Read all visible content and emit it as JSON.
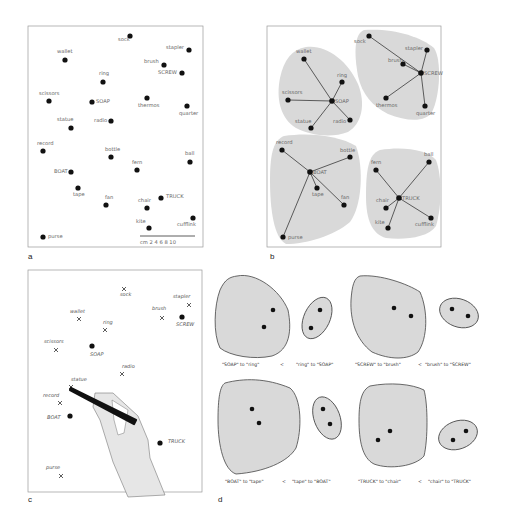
{
  "panels": {
    "a": {
      "letter": "a",
      "items": [
        {
          "label": "sock",
          "x": 130,
          "y": 36,
          "lx": -12,
          "ly": 5
        },
        {
          "label": "stapler",
          "x": 189,
          "y": 50,
          "lx": -23,
          "ly": -1
        },
        {
          "label": "wallet",
          "x": 65,
          "y": 60,
          "lx": -8,
          "ly": -7
        },
        {
          "label": "brush",
          "x": 164,
          "y": 65,
          "lx": -20,
          "ly": -2
        },
        {
          "label": "SCREW",
          "x": 182,
          "y": 73,
          "lx": -24,
          "ly": 1
        },
        {
          "label": "ring",
          "x": 103,
          "y": 82,
          "lx": -4,
          "ly": -7
        },
        {
          "label": "scissors",
          "x": 49,
          "y": 101,
          "lx": -10,
          "ly": -6
        },
        {
          "label": "SOAP",
          "x": 92,
          "y": 102,
          "lx": 4,
          "ly": 1
        },
        {
          "label": "thermos",
          "x": 147,
          "y": 98,
          "lx": -9,
          "ly": 9
        },
        {
          "label": "quarter",
          "x": 187,
          "y": 106,
          "lx": -8,
          "ly": 9
        },
        {
          "label": "radio",
          "x": 111,
          "y": 121,
          "lx": -17,
          "ly": 1
        },
        {
          "label": "statue",
          "x": 71,
          "y": 128,
          "lx": -14,
          "ly": -7
        },
        {
          "label": "record",
          "x": 43,
          "y": 151,
          "lx": -6,
          "ly": -6
        },
        {
          "label": "bottle",
          "x": 111,
          "y": 157,
          "lx": -6,
          "ly": -6
        },
        {
          "label": "ball",
          "x": 190,
          "y": 162,
          "lx": -5,
          "ly": -7
        },
        {
          "label": "fern",
          "x": 137,
          "y": 170,
          "lx": -5,
          "ly": -6
        },
        {
          "label": "BOAT",
          "x": 71,
          "y": 172,
          "lx": -17,
          "ly": 1
        },
        {
          "label": "tape",
          "x": 78,
          "y": 188,
          "lx": -5,
          "ly": 8
        },
        {
          "label": "TRUCK",
          "x": 161,
          "y": 198,
          "lx": 5,
          "ly": 0
        },
        {
          "label": "fan",
          "x": 106,
          "y": 205,
          "lx": -1,
          "ly": -6
        },
        {
          "label": "chair",
          "x": 147,
          "y": 208,
          "lx": -9,
          "ly": -6
        },
        {
          "label": "cufflink",
          "x": 193,
          "y": 218,
          "lx": -16,
          "ly": 8
        },
        {
          "label": "kite",
          "x": 149,
          "y": 228,
          "lx": -13,
          "ly": -5
        },
        {
          "label": "purse",
          "x": 43,
          "y": 237,
          "lx": 5,
          "ly": 1
        }
      ],
      "scale": {
        "unit": "cm",
        "ticks": [
          "2",
          "4",
          "6",
          "8",
          "10"
        ]
      }
    },
    "b": {
      "letter": "b",
      "clusters": [
        {
          "hub": "SOAP",
          "hx": 332,
          "hy": 101,
          "members": [
            {
              "label": "wallet",
              "x": 304,
              "y": 59,
              "lx": -8,
              "ly": -6
            },
            {
              "label": "ring",
              "x": 342,
              "y": 82,
              "lx": -5,
              "ly": -5
            },
            {
              "label": "scissors",
              "x": 288,
              "y": 100,
              "lx": -6,
              "ly": -6
            },
            {
              "label": "statue",
              "x": 311,
              "y": 128,
              "lx": -16,
              "ly": -5
            },
            {
              "label": "radio",
              "x": 350,
              "y": 120,
              "lx": -17,
              "ly": 3
            }
          ]
        },
        {
          "hub": "SCREW",
          "hx": 421,
          "hy": 73,
          "members": [
            {
              "label": "sock",
              "x": 369,
              "y": 36,
              "lx": -15,
              "ly": 7
            },
            {
              "label": "stapler",
              "x": 427,
              "y": 50,
              "lx": -22,
              "ly": 0
            },
            {
              "label": "brush",
              "x": 403,
              "y": 64,
              "lx": -15,
              "ly": -2
            },
            {
              "label": "thermos",
              "x": 386,
              "y": 98,
              "lx": -10,
              "ly": 9
            },
            {
              "label": "quarter",
              "x": 425,
              "y": 106,
              "lx": -9,
              "ly": 9
            }
          ]
        },
        {
          "hub": "BOAT",
          "hx": 310,
          "hy": 172,
          "members": [
            {
              "label": "record",
              "x": 282,
              "y": 150,
              "lx": -6,
              "ly": -6
            },
            {
              "label": "bottle",
              "x": 350,
              "y": 157,
              "lx": -10,
              "ly": -5
            },
            {
              "label": "tape",
              "x": 317,
              "y": 188,
              "lx": -5,
              "ly": 8
            },
            {
              "label": "fan",
              "x": 344,
              "y": 205,
              "lx": -3,
              "ly": -6
            },
            {
              "label": "purse",
              "x": 283,
              "y": 237,
              "lx": 5,
              "ly": 2
            }
          ]
        },
        {
          "hub": "TRUCK",
          "hx": 399,
          "hy": 198,
          "members": [
            {
              "label": "fern",
              "x": 376,
              "y": 170,
              "lx": -5,
              "ly": -6
            },
            {
              "label": "ball",
              "x": 429,
              "y": 162,
              "lx": -5,
              "ly": -6
            },
            {
              "label": "chair",
              "x": 386,
              "y": 208,
              "lx": -10,
              "ly": -6
            },
            {
              "label": "kite",
              "x": 388,
              "y": 228,
              "lx": -13,
              "ly": -4
            },
            {
              "label": "cufflink",
              "x": 431,
              "y": 218,
              "lx": -16,
              "ly": 8
            }
          ]
        }
      ],
      "hub_labels": {
        "SOAP": "SOAP",
        "SCREW": "SCREW",
        "BOAT": "BOAT",
        "TRUCK": "TRUCK"
      }
    },
    "c": {
      "letter": "c",
      "crosses": [
        {
          "label": "sock",
          "x": 124,
          "y": 289,
          "lx": -4,
          "ly": 7
        },
        {
          "label": "stapler",
          "x": 189,
          "y": 305,
          "lx": -16,
          "ly": -7
        },
        {
          "label": "wallet",
          "x": 79,
          "y": 319,
          "lx": -9,
          "ly": -6
        },
        {
          "label": "brush",
          "x": 162,
          "y": 318,
          "lx": -10,
          "ly": -8
        },
        {
          "label": "ring",
          "x": 105,
          "y": 330,
          "lx": -2,
          "ly": -6
        },
        {
          "label": "scissors",
          "x": 56,
          "y": 350,
          "lx": -12,
          "ly": -7
        },
        {
          "label": "radio",
          "x": 122,
          "y": 374,
          "lx": 0,
          "ly": -6
        },
        {
          "label": "statue",
          "x": 71,
          "y": 387,
          "lx": 0,
          "ly": -6
        },
        {
          "label": "record",
          "x": 60,
          "y": 403,
          "lx": -17,
          "ly": -6
        },
        {
          "label": "purse",
          "x": 61,
          "y": 476,
          "lx": -15,
          "ly": -7
        }
      ],
      "dots": [
        {
          "label": "SCREW",
          "x": 182,
          "y": 317,
          "lx": -6,
          "ly": 9
        },
        {
          "label": "SOAP",
          "x": 92,
          "y": 346,
          "lx": -2,
          "ly": 10
        },
        {
          "label": "BOAT",
          "x": 70,
          "y": 416,
          "lx": -23,
          "ly": 3
        },
        {
          "label": "TRUCK",
          "x": 160,
          "y": 443,
          "lx": 8,
          "ly": 0
        }
      ]
    },
    "d": {
      "letter": "d",
      "comparisons": [
        {
          "left": "\"SOAP\" to \"ring\"",
          "op": "<",
          "right": "\"ring\" to \"SOAP\""
        },
        {
          "left": "\"SCREW\" to \"brush\"",
          "op": "<",
          "right": "\"brush\" to \"SCREW\""
        },
        {
          "left": "\"BOAT\" to \"tape\"",
          "op": "<",
          "right": "\"tape\" to \"BOAT\""
        },
        {
          "left": "\"TRUCK\" to \"chair\"",
          "op": "<",
          "right": "\"chair\" to \"TRUCK\""
        }
      ]
    }
  },
  "colors": {
    "blob": "#d9d9d9",
    "blob_stroke": "#444444",
    "dot": "#111111",
    "frame": "#999999",
    "label": "#666666"
  }
}
